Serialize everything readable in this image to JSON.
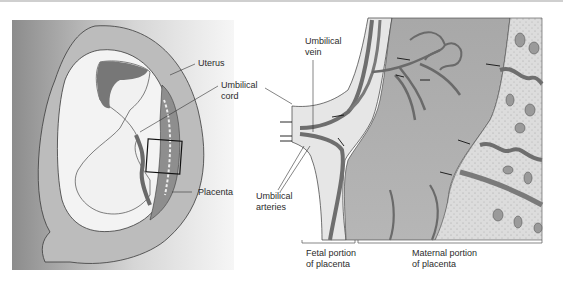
{
  "figure": {
    "left_panel": {
      "name": "Uterus cross-section with fetus",
      "labels": {
        "uterus": "Uterus",
        "umbilical_cord": "Umbilical\ncord",
        "placenta": "Placenta"
      }
    },
    "right_panel": {
      "name": "Enlarged placenta section",
      "labels": {
        "umbilical_vein": "Umbilical\nvein",
        "umbilical_arteries": "Umbilical\narteries",
        "fetal_portion": "Fetal portion\nof placenta",
        "maternal_portion": "Maternal portion\nof placenta"
      }
    },
    "colors": {
      "background_gradient_dark": "#8a8a8a",
      "background_gradient_light": "#f4f4f4",
      "uterus_wall": "#b9b9b9",
      "vessel": "#6e6e6e",
      "maternal_tissue": "#a9a9a9",
      "stippled_region": "#d9d9d9",
      "line": "#333333"
    }
  }
}
